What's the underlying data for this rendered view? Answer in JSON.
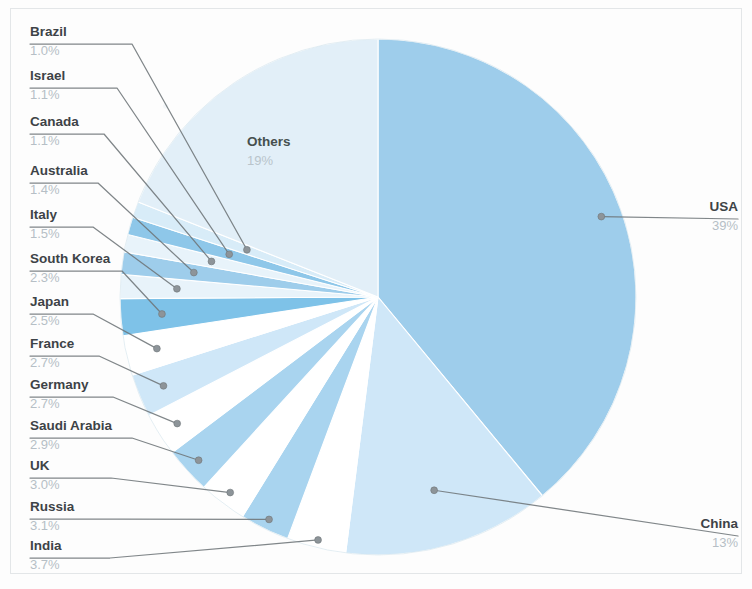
{
  "chart_data": {
    "type": "pie",
    "title": "",
    "subtitle": "",
    "xlabel": "",
    "ylabel": "",
    "legend_position": "none",
    "grid": false,
    "unit": "%",
    "start_angle_deg": 0,
    "direction": "clockwise",
    "categories": [
      "USA",
      "China",
      "India",
      "Russia",
      "UK",
      "Saudi Arabia",
      "Germany",
      "France",
      "Japan",
      "South Korea",
      "Italy",
      "Australia",
      "Canada",
      "Israel",
      "Brazil",
      "Others"
    ],
    "values": [
      39,
      13,
      3.7,
      3.1,
      3.0,
      2.9,
      2.7,
      2.7,
      2.5,
      2.3,
      1.5,
      1.4,
      1.1,
      1.1,
      1.0,
      19
    ],
    "value_labels": [
      "39%",
      "13%",
      "3.7%",
      "3.1%",
      "3.0%",
      "2.9%",
      "2.7%",
      "2.7%",
      "2.5%",
      "2.3%",
      "1.5%",
      "1.4%",
      "1.1%",
      "1.1%",
      "1.0%",
      "19%"
    ],
    "slices": [
      {
        "label": "USA",
        "value": 39,
        "value_label": "39%",
        "color": "#9ecdeb",
        "label_position": "right-callout"
      },
      {
        "label": "China",
        "value": 13,
        "value_label": "13%",
        "color": "#cfe7f8",
        "label_position": "right-callout"
      },
      {
        "label": "India",
        "value": 3.7,
        "value_label": "3.7%",
        "color": "#ffffff",
        "label_position": "left-callout"
      },
      {
        "label": "Russia",
        "value": 3.1,
        "value_label": "3.1%",
        "color": "#a9d4ef",
        "label_position": "left-callout"
      },
      {
        "label": "UK",
        "value": 3.0,
        "value_label": "3.0%",
        "color": "#ffffff",
        "label_position": "left-callout"
      },
      {
        "label": "Saudi Arabia",
        "value": 2.9,
        "value_label": "2.9%",
        "color": "#a9d4ef",
        "label_position": "left-callout"
      },
      {
        "label": "Germany",
        "value": 2.7,
        "value_label": "2.7%",
        "color": "#ffffff",
        "label_position": "left-callout"
      },
      {
        "label": "France",
        "value": 2.7,
        "value_label": "2.7%",
        "color": "#cfe7f8",
        "label_position": "left-callout"
      },
      {
        "label": "Japan",
        "value": 2.5,
        "value_label": "2.5%",
        "color": "#ffffff",
        "label_position": "left-callout"
      },
      {
        "label": "South Korea",
        "value": 2.3,
        "value_label": "2.3%",
        "color": "#7ec2e8",
        "label_position": "left-callout"
      },
      {
        "label": "Italy",
        "value": 1.5,
        "value_label": "1.5%",
        "color": "#e8f3fa",
        "label_position": "left-callout"
      },
      {
        "label": "Australia",
        "value": 1.4,
        "value_label": "1.4%",
        "color": "#9ecdeb",
        "label_position": "left-callout"
      },
      {
        "label": "Canada",
        "value": 1.1,
        "value_label": "1.1%",
        "color": "#e8f3fa",
        "label_position": "left-callout"
      },
      {
        "label": "Israel",
        "value": 1.1,
        "value_label": "1.1%",
        "color": "#8ec7e9",
        "label_position": "left-callout"
      },
      {
        "label": "Brazil",
        "value": 1.0,
        "value_label": "1.0%",
        "color": "#d8ecf8",
        "label_position": "left-callout"
      },
      {
        "label": "Others",
        "value": 19,
        "value_label": "19%",
        "color": "#e2eff8",
        "label_position": "inside"
      }
    ],
    "colors": {
      "accent_strong": "#7ec2e8",
      "accent": "#9ecdeb",
      "accent_light": "#cfe7f8",
      "accent_pale": "#e2eff8",
      "label_text": "#3d4347",
      "percent_text": "#b6bfc6",
      "leader_line": "#6e7579",
      "background": "#fdfdfd",
      "frame": "#e3e6e8"
    }
  },
  "labels": {
    "brazil": {
      "name": "Brazil",
      "pct": "1.0%"
    },
    "israel": {
      "name": "Israel",
      "pct": "1.1%"
    },
    "canada": {
      "name": "Canada",
      "pct": "1.1%"
    },
    "australia": {
      "name": "Australia",
      "pct": "1.4%"
    },
    "italy": {
      "name": "Italy",
      "pct": "1.5%"
    },
    "south_korea": {
      "name": "South Korea",
      "pct": "2.3%"
    },
    "japan": {
      "name": "Japan",
      "pct": "2.5%"
    },
    "france": {
      "name": "France",
      "pct": "2.7%"
    },
    "germany": {
      "name": "Germany",
      "pct": "2.7%"
    },
    "saudi_arabia": {
      "name": "Saudi Arabia",
      "pct": "2.9%"
    },
    "uk": {
      "name": "UK",
      "pct": "3.0%"
    },
    "russia": {
      "name": "Russia",
      "pct": "3.1%"
    },
    "india": {
      "name": "India",
      "pct": "3.7%"
    },
    "usa": {
      "name": "USA",
      "pct": "39%"
    },
    "china": {
      "name": "China",
      "pct": "13%"
    },
    "others": {
      "name": "Others",
      "pct": "19%"
    }
  }
}
